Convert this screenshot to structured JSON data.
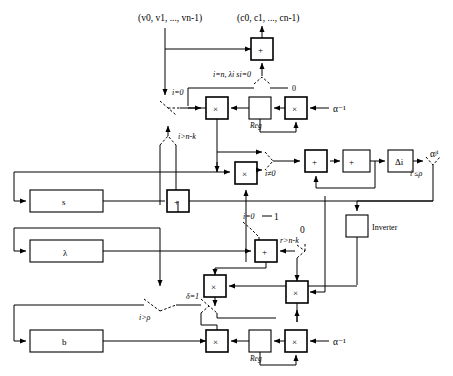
{
  "diagram": {
    "io": {
      "input_vector": "(v0, v1, ..., vn-1)",
      "output_vector": "(c0, c1, ..., cn-1)"
    },
    "registers": [
      {
        "id": "reg-s",
        "label": "s"
      },
      {
        "id": "reg-lambda",
        "label": "λ"
      },
      {
        "id": "reg-b",
        "label": "b"
      }
    ],
    "blocks": [
      {
        "id": "adder-top",
        "label": "+",
        "kind": "adder"
      },
      {
        "id": "mult-top",
        "label": "×",
        "kind": "multiplier"
      },
      {
        "id": "reg-top",
        "label": "Reg",
        "kind": "register"
      },
      {
        "id": "mult-top-right",
        "label": "×",
        "kind": "multiplier"
      },
      {
        "id": "mult-mid",
        "label": "×",
        "kind": "multiplier"
      },
      {
        "id": "adder-s",
        "label": "+",
        "kind": "adder"
      },
      {
        "id": "adder-delta",
        "label": "+",
        "kind": "adder"
      },
      {
        "id": "delta-i",
        "label": "Δi",
        "kind": "delta"
      },
      {
        "id": "delta",
        "label": "Δ",
        "kind": "delta"
      },
      {
        "id": "inverter",
        "label": "Inverter",
        "kind": "inverter"
      },
      {
        "id": "adder-lambda",
        "label": "+",
        "kind": "adder"
      },
      {
        "id": "mult-lambda",
        "label": "×",
        "kind": "multiplier"
      },
      {
        "id": "mult-inv",
        "label": "×",
        "kind": "multiplier"
      },
      {
        "id": "mult-bottom",
        "label": "×",
        "kind": "multiplier"
      },
      {
        "id": "reg-bottom",
        "label": "Reg",
        "kind": "register"
      },
      {
        "id": "mult-bottom-right",
        "label": "×",
        "kind": "multiplier"
      }
    ],
    "mux_labels": [
      {
        "id": "mux-i-eq-0-top",
        "label": "i=0"
      },
      {
        "id": "mux-i-gt-nk-top",
        "label": "i>n-k"
      },
      {
        "id": "mux-i-n-lambda",
        "label": "i=n, λi si=0"
      },
      {
        "id": "mux-i-ne-0",
        "label": "i≠0"
      },
      {
        "id": "mux-i-le-rho",
        "label": "i ≤ρ"
      },
      {
        "id": "mux-i-eq-0-mid",
        "label": "i=0"
      },
      {
        "id": "mux-r-gt-nk",
        "label": "r>n-k"
      },
      {
        "id": "mux-i-gt-rho",
        "label": "i>ρ"
      },
      {
        "id": "mux-delta-eq-1",
        "label": "δ=1"
      }
    ],
    "constants": [
      {
        "id": "const-zero-top",
        "label": "0"
      },
      {
        "id": "const-one-mid",
        "label": "1"
      },
      {
        "id": "const-zero-mid",
        "label": "0"
      },
      {
        "id": "alpha-inv-top",
        "label": "α⁻¹"
      },
      {
        "id": "alpha-inv-bottom",
        "label": "α⁻¹"
      },
      {
        "id": "alpha-ji",
        "label": "αʲⁱ"
      }
    ],
    "colors": {
      "line": "#000000",
      "fill": "#ffffff",
      "background": "#ffffff"
    }
  }
}
